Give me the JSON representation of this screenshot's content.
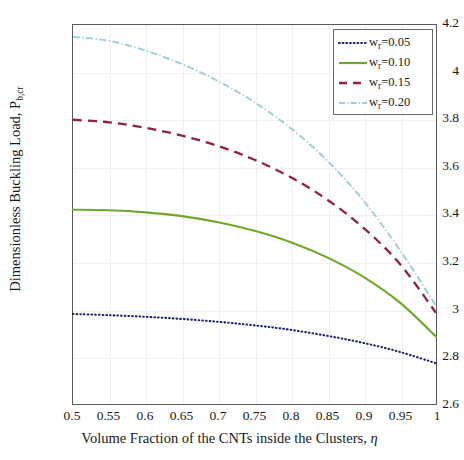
{
  "figure": {
    "top_cut_text": "",
    "bottom_caption_cut": ""
  },
  "axes": {
    "x_title_main": "Volume Fraction of the CNTs inside the Clusters, ",
    "x_title_symbol": "η",
    "y_title_main": "Dimensionless Buckling Load, P",
    "y_title_sub": "b,cr",
    "x_ticks": [
      "0.5",
      "0.55",
      "0.6",
      "0.65",
      "0.7",
      "0.75",
      "0.8",
      "0.85",
      "0.9",
      "0.95",
      "1"
    ],
    "y_ticks": [
      "4.2",
      "4",
      "3.8",
      "3.6",
      "3.4",
      "3.2",
      "3",
      "2.8",
      "2.6"
    ]
  },
  "legend": {
    "position": "top-right",
    "entries": [
      {
        "symbol": "w",
        "sub": "r",
        "eq": "=0.05",
        "label": "w_r=0.05",
        "color": "#1b1f6e",
        "style": "dotted"
      },
      {
        "symbol": "w",
        "sub": "r",
        "eq": "=0.10",
        "label": "w_r=0.10",
        "color": "#6fa82a",
        "style": "solid"
      },
      {
        "symbol": "w",
        "sub": "r",
        "eq": "=0.15",
        "label": "w_r=0.15",
        "color": "#8f2245",
        "style": "dashed"
      },
      {
        "symbol": "w",
        "sub": "r",
        "eq": "=0.20",
        "label": "w_r=0.20",
        "color": "#9ccfd8",
        "style": "dashdot"
      }
    ]
  },
  "chart_data": {
    "type": "line",
    "title": "",
    "xlabel": "Volume Fraction of the CNTs inside the Clusters, η",
    "ylabel": "Dimensionless Buckling Load, P_b,cr",
    "xlim": [
      0.5,
      1.0
    ],
    "ylim": [
      2.6,
      4.2
    ],
    "grid": true,
    "x": [
      0.5,
      0.55,
      0.6,
      0.65,
      0.7,
      0.75,
      0.8,
      0.85,
      0.9,
      0.95,
      1.0
    ],
    "series": [
      {
        "name": "w_r=0.05",
        "color": "#1b1f6e",
        "linestyle": "dotted",
        "values": [
          2.98,
          2.975,
          2.968,
          2.959,
          2.947,
          2.932,
          2.913,
          2.888,
          2.858,
          2.82,
          2.772
        ]
      },
      {
        "name": "w_r=0.10",
        "color": "#6fa82a",
        "linestyle": "solid",
        "values": [
          3.42,
          3.418,
          3.409,
          3.393,
          3.367,
          3.331,
          3.283,
          3.219,
          3.137,
          3.029,
          2.885
        ]
      },
      {
        "name": "w_r=0.15",
        "color": "#8f2245",
        "linestyle": "dashed",
        "values": [
          3.8,
          3.789,
          3.766,
          3.733,
          3.689,
          3.631,
          3.557,
          3.463,
          3.344,
          3.192,
          2.985
        ]
      },
      {
        "name": "w_r=0.20",
        "color": "#9ccfd8",
        "linestyle": "dashdot",
        "values": [
          4.15,
          4.133,
          4.092,
          4.035,
          3.963,
          3.874,
          3.764,
          3.628,
          3.459,
          3.251,
          3.015
        ]
      }
    ]
  },
  "colors": {
    "frame": "#5a5a5a",
    "grid": "#f0f0f0",
    "background": "#ffffff"
  }
}
